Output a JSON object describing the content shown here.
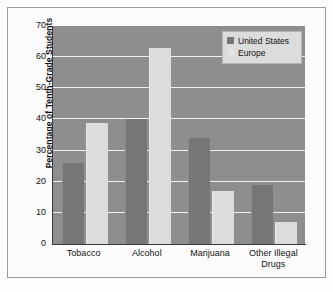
{
  "chart_data": {
    "type": "bar",
    "title": "",
    "xlabel": "",
    "ylabel": "Percentage of Tenth-Grade Students",
    "categories": [
      "Tobacco",
      "Alcohol",
      "Marijuana",
      "Other Illegal Drugs"
    ],
    "category_lines": [
      [
        "Tobacco"
      ],
      [
        "Alcohol"
      ],
      [
        "Marijuana"
      ],
      [
        "Other Illegal",
        "Drugs"
      ]
    ],
    "series": [
      {
        "name": "United States",
        "values": [
          26,
          40,
          34,
          19
        ],
        "color": "#767676"
      },
      {
        "name": "Europe",
        "values": [
          39,
          63,
          17,
          7
        ],
        "color": "#dcdcdc"
      }
    ],
    "ylim": [
      0,
      70
    ],
    "yticks": [
      0,
      10,
      20,
      30,
      40,
      50,
      60,
      70
    ],
    "ytick_labels": [
      "0",
      "10",
      "20",
      "30",
      "40",
      "50",
      "60",
      "70"
    ],
    "grid": true,
    "grid_color": "#f0f0f0",
    "plot_background": "#8e8e8e",
    "legend_position": "upper-right",
    "legend_entries": [
      "United States",
      "Europe"
    ]
  }
}
